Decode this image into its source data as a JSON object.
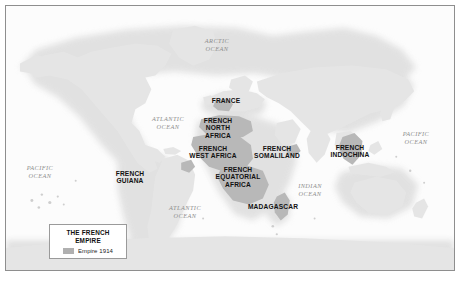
{
  "figure": {
    "title": "The French Empire",
    "projection": "world-map",
    "background_color": "#ffffff",
    "frame_color": "#8e8e8e",
    "ocean_color": "#fbfbfb",
    "land_color": "#e2e2e2",
    "empire_color": "#b0b0b0",
    "halo_color": "#eeeeee"
  },
  "legend": {
    "title_line_1": "THE FRENCH",
    "title_line_2": "EMPIRE",
    "entries": [
      {
        "label": "Empire 1914",
        "color": "#b0b0b0"
      }
    ]
  },
  "territory_labels": [
    {
      "id": "france",
      "text": "FRANCE",
      "x": 226,
      "y": 101
    },
    {
      "id": "french-north-africa",
      "text": "FRENCH\nNORTH\nAFRICA",
      "x": 218,
      "y": 128
    },
    {
      "id": "french-west-africa",
      "text": "FRENCH\nWEST AFRICA",
      "x": 213,
      "y": 152
    },
    {
      "id": "french-equatorial-africa",
      "text": "FRENCH\nEQUATORIAL\nAFRICA",
      "x": 238,
      "y": 177
    },
    {
      "id": "french-somaliland",
      "text": "FRENCH\nSOMALILAND",
      "x": 277,
      "y": 152
    },
    {
      "id": "french-indochina",
      "text": "FRENCH\nINDOCHINA",
      "x": 350,
      "y": 151
    },
    {
      "id": "madagascar",
      "text": "MADAGASCAR",
      "x": 273,
      "y": 207
    },
    {
      "id": "french-guiana",
      "text": "FRENCH\nGUIANA",
      "x": 130,
      "y": 177
    }
  ],
  "ocean_labels": [
    {
      "id": "arctic-ocean",
      "text": "ARCTIC\nOCEAN",
      "x": 217,
      "y": 45
    },
    {
      "id": "atlantic-ocean-north",
      "text": "ATLANTIC\nOCEAN",
      "x": 168,
      "y": 123
    },
    {
      "id": "atlantic-ocean-south",
      "text": "ATLANTIC\nOCEAN",
      "x": 185,
      "y": 212
    },
    {
      "id": "pacific-ocean-west",
      "text": "PACIFIC\nOCEAN",
      "x": 40,
      "y": 172
    },
    {
      "id": "pacific-ocean-east",
      "text": "PACIFIC\nOCEAN",
      "x": 416,
      "y": 138
    },
    {
      "id": "indian-ocean",
      "text": "INDIAN\nOCEAN",
      "x": 310,
      "y": 190
    }
  ]
}
